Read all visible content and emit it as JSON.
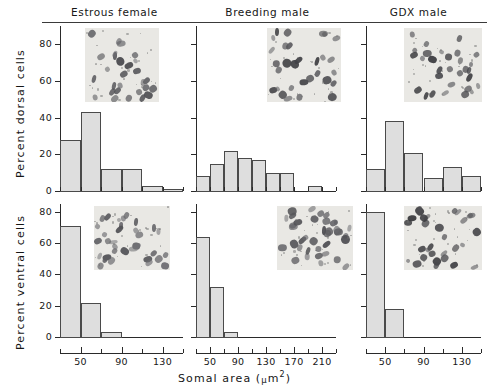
{
  "figure": {
    "ylabel_top": "Percent dorsal cells",
    "ylabel_bottom": "Percent ventral cells",
    "xlabel_text": "Somal area (",
    "xlabel_mu": "μ",
    "xlabel_unit": "m",
    "xlabel_sup": "2",
    "xlabel_close": ")"
  },
  "columns": [
    {
      "title": "Estrous female"
    },
    {
      "title": "Breeding male"
    },
    {
      "title": "GDX male"
    }
  ],
  "chart_data": {
    "type": "bar",
    "xlabel": "Somal area (μm²)",
    "grid": false,
    "legend": "none",
    "panels": [
      {
        "id": "estrous-female-dorsal",
        "row": "dorsal",
        "group": "Estrous female",
        "ylabel": "Percent dorsal cells",
        "ylim": [
          0,
          90
        ],
        "yticks": [
          0,
          20,
          40,
          60,
          80
        ],
        "ytick_labels": [
          "0",
          "20",
          "40",
          "60",
          "80"
        ],
        "xlim": [
          30,
          150
        ],
        "bin_width": 20,
        "xticks": [
          30,
          50,
          70,
          90,
          110,
          130,
          150
        ],
        "xtick_labels": [
          "",
          "50",
          "",
          "90",
          "",
          "130",
          ""
        ],
        "bin_starts": [
          30,
          50,
          70,
          90,
          110,
          130
        ],
        "values": [
          28,
          43,
          12,
          12,
          3,
          1
        ]
      },
      {
        "id": "breeding-male-dorsal",
        "row": "dorsal",
        "group": "Breeding male",
        "ylabel": "Percent dorsal cells",
        "ylim": [
          0,
          90
        ],
        "yticks": [
          0,
          20,
          40,
          60,
          80
        ],
        "ytick_labels": [
          "",
          "",
          "",
          "",
          ""
        ],
        "xlim": [
          30,
          230
        ],
        "bin_width": 20,
        "xticks": [
          30,
          50,
          70,
          90,
          110,
          130,
          150,
          170,
          190,
          210,
          230
        ],
        "xtick_labels": [
          "",
          "50",
          "",
          "90",
          "",
          "130",
          "",
          "170",
          "",
          "210",
          ""
        ],
        "bin_starts": [
          30,
          50,
          70,
          90,
          110,
          130,
          150,
          190
        ],
        "values": [
          8,
          15,
          22,
          18,
          17,
          10,
          10,
          3
        ]
      },
      {
        "id": "gdx-male-dorsal",
        "row": "dorsal",
        "group": "GDX male",
        "ylabel": "Percent dorsal cells",
        "ylim": [
          0,
          90
        ],
        "yticks": [
          0,
          20,
          40,
          60,
          80
        ],
        "ytick_labels": [
          "",
          "",
          "",
          "",
          ""
        ],
        "xlim": [
          30,
          150
        ],
        "bin_width": 20,
        "xticks": [
          30,
          50,
          70,
          90,
          110,
          130,
          150
        ],
        "xtick_labels": [
          "",
          "50",
          "",
          "90",
          "",
          "130",
          ""
        ],
        "bin_starts": [
          30,
          50,
          70,
          90,
          110,
          130
        ],
        "values": [
          12,
          38,
          21,
          7,
          13,
          8
        ]
      },
      {
        "id": "estrous-female-ventral",
        "row": "ventral",
        "group": "Estrous female",
        "ylabel": "Percent ventral cells",
        "ylim": [
          0,
          85
        ],
        "yticks": [
          0,
          20,
          40,
          60,
          80
        ],
        "ytick_labels": [
          "0",
          "20",
          "40",
          "60",
          "80"
        ],
        "xlim": [
          30,
          150
        ],
        "bin_width": 20,
        "xticks": [
          30,
          50,
          70,
          90,
          110,
          130,
          150
        ],
        "xtick_labels": [
          "",
          "50",
          "",
          "90",
          "",
          "130",
          ""
        ],
        "bin_starts": [
          30,
          50,
          70
        ],
        "values": [
          71,
          22,
          3
        ]
      },
      {
        "id": "breeding-male-ventral",
        "row": "ventral",
        "group": "Breeding male",
        "ylabel": "Percent ventral cells",
        "ylim": [
          0,
          85
        ],
        "yticks": [
          0,
          20,
          40,
          60,
          80
        ],
        "ytick_labels": [
          "",
          "",
          "",
          "",
          ""
        ],
        "xlim": [
          30,
          230
        ],
        "bin_width": 20,
        "xticks": [
          30,
          50,
          70,
          90,
          110,
          130,
          150,
          170,
          190,
          210,
          230
        ],
        "xtick_labels": [
          "",
          "50",
          "",
          "90",
          "",
          "130",
          "",
          "170",
          "",
          "210",
          ""
        ],
        "bin_starts": [
          30,
          50,
          70
        ],
        "values": [
          64,
          32,
          3
        ]
      },
      {
        "id": "gdx-male-ventral",
        "row": "ventral",
        "group": "GDX male",
        "ylabel": "Percent ventral cells",
        "ylim": [
          0,
          85
        ],
        "yticks": [
          0,
          20,
          40,
          60,
          80
        ],
        "ytick_labels": [
          "",
          "",
          "",
          "",
          ""
        ],
        "xlim": [
          30,
          150
        ],
        "bin_width": 20,
        "xticks": [
          30,
          50,
          70,
          90,
          110,
          130,
          150
        ],
        "xtick_labels": [
          "",
          "50",
          "",
          "90",
          "",
          "130",
          ""
        ],
        "bin_starts": [
          30,
          50
        ],
        "values": [
          80,
          18
        ]
      }
    ],
    "insets": [
      {
        "id": "inset-estrous-female-dorsal",
        "panel": "estrous-female-dorsal",
        "kind": "micrograph"
      },
      {
        "id": "inset-breeding-male-dorsal",
        "panel": "breeding-male-dorsal",
        "kind": "micrograph"
      },
      {
        "id": "inset-gdx-male-dorsal",
        "panel": "gdx-male-dorsal",
        "kind": "micrograph"
      },
      {
        "id": "inset-estrous-female-ventral",
        "panel": "estrous-female-ventral",
        "kind": "micrograph"
      },
      {
        "id": "inset-breeding-male-ventral",
        "panel": "breeding-male-ventral",
        "kind": "micrograph"
      },
      {
        "id": "inset-gdx-male-ventral",
        "panel": "gdx-male-ventral",
        "kind": "micrograph"
      }
    ]
  }
}
